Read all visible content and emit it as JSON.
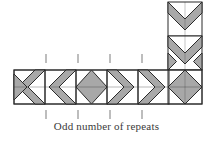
{
  "figure": {
    "title": "Odd number of repeats",
    "caption": "Odd number of repeats",
    "type": "geometric-pattern-diagram"
  },
  "colors": {
    "fill": "#a8a8a8",
    "stroke": "#2b2b2b",
    "background": "#ffffff",
    "tick": "#9a9a9a",
    "caption_text": "#3a3a3a"
  },
  "layout": {
    "canvas_width": 213,
    "canvas_height": 141,
    "cell_size": 34,
    "strip_left": 14,
    "strip_top": 70,
    "strip_cells": 6,
    "column_left": 168,
    "column_top": 2,
    "column_cells": 2
  },
  "pattern": {
    "horizontal_cells": [
      {
        "index": 0,
        "motif": "chevron-left"
      },
      {
        "index": 1,
        "motif": "chevron-left"
      },
      {
        "index": 2,
        "motif": "diamond"
      },
      {
        "index": 3,
        "motif": "chevron-right"
      },
      {
        "index": 4,
        "motif": "chevron-right"
      },
      {
        "index": 5,
        "motif": "diamond-corner"
      }
    ],
    "vertical_cells": [
      {
        "index": 0,
        "motif": "chevron-down"
      },
      {
        "index": 1,
        "motif": "chevron-down"
      }
    ],
    "repeat_count_label": "Odd number of repeats"
  },
  "tick_marks": {
    "count": 4,
    "positions_x": [
      46,
      78,
      110,
      142
    ],
    "top_y": 54,
    "top_height": 9,
    "bottom_y": 108,
    "bottom_height": 9
  }
}
